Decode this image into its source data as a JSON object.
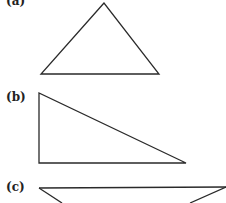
{
  "figure": {
    "panels": [
      {
        "label": "(a)",
        "shape": "acute-triangle",
        "label_pos": [
          6,
          -6
        ],
        "points": "104,3 41,74 159,74"
      },
      {
        "label": "(b)",
        "shape": "right-triangle",
        "label_pos": [
          6,
          91
        ],
        "points": "39,93 39,163 186,163"
      },
      {
        "label": "(c)",
        "shape": "obtuse-triangle",
        "label_pos": [
          6,
          180
        ],
        "points": "39,188 226,187 226,187 120,240"
      }
    ],
    "stroke_color": "#2a2a2a",
    "background": "#ffffff"
  }
}
